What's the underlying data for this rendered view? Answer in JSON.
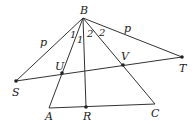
{
  "diagram": {
    "points": {
      "B": {
        "x": 83,
        "y": 18,
        "label": "B"
      },
      "S": {
        "x": 16,
        "y": 81,
        "label": "S"
      },
      "T": {
        "x": 182,
        "y": 57,
        "label": "T"
      },
      "U": {
        "x": 62,
        "y": 73,
        "label": "U"
      },
      "V": {
        "x": 123,
        "y": 65,
        "label": "V"
      },
      "A": {
        "x": 49,
        "y": 108,
        "label": "A"
      },
      "R": {
        "x": 86,
        "y": 107,
        "label": "R"
      },
      "C": {
        "x": 155,
        "y": 104,
        "label": "C"
      }
    },
    "segment_labels": {
      "BS": "p",
      "BT": "p"
    },
    "angle_labels": {
      "left_1": "1",
      "left_2": "1",
      "right_1": "2",
      "right_2": "2"
    }
  }
}
